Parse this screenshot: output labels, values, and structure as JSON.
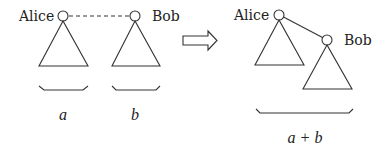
{
  "diagram": {
    "type": "tree-merge",
    "colors": {
      "stroke": "#333333",
      "text": "#222222",
      "background": "#ffffff"
    },
    "before": {
      "left_tree": {
        "root_label": "Alice",
        "size_label": "a"
      },
      "right_tree": {
        "root_label": "Bob",
        "size_label": "b"
      },
      "link": "dashed"
    },
    "transition_icon": "right-arrow-icon",
    "after": {
      "root_label": "Alice",
      "child_label": "Bob",
      "size_label": "a + b",
      "link": "solid"
    }
  }
}
